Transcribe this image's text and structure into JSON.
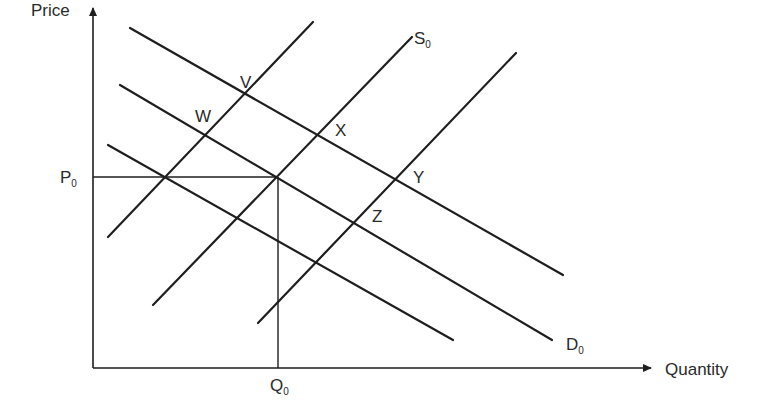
{
  "diagram": {
    "type": "supply-demand",
    "axes": {
      "y_label": "Price",
      "x_label": "Quantity"
    },
    "reference": {
      "price_label": "P",
      "price_sub": "0",
      "quantity_label": "Q",
      "quantity_sub": "0"
    },
    "curve_labels": {
      "supply": "S",
      "supply_sub": "0",
      "demand": "D",
      "demand_sub": "0"
    },
    "points": [
      {
        "label": "V"
      },
      {
        "label": "W"
      },
      {
        "label": "X"
      },
      {
        "label": "Y"
      },
      {
        "label": "Z"
      }
    ],
    "colors": {
      "line": "#1e1e1e",
      "text": "#2a2a2a",
      "background": "#ffffff"
    }
  }
}
